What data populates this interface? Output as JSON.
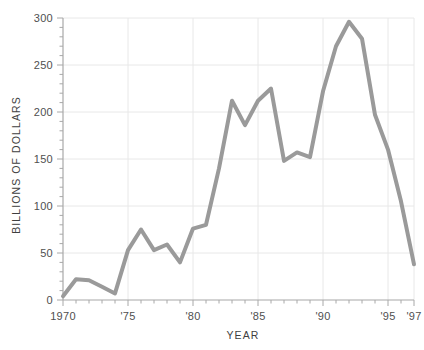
{
  "chart_data": {
    "type": "line",
    "title": "",
    "xlabel": "YEAR",
    "ylabel": "BILLIONS OF DOLLARS",
    "xlim": [
      1970,
      1997
    ],
    "ylim": [
      0,
      300
    ],
    "grid": true,
    "legend": null,
    "line_color": "#9a9a9a",
    "grid_color": "#e8e8e8",
    "axis_color": "#a8a8a8",
    "background_color": "#ffffff",
    "x": [
      1970,
      1971,
      1972,
      1973,
      1974,
      1975,
      1976,
      1977,
      1978,
      1979,
      1980,
      1981,
      1982,
      1983,
      1984,
      1985,
      1986,
      1987,
      1988,
      1989,
      1990,
      1991,
      1992,
      1993,
      1994,
      1995,
      1996,
      1997
    ],
    "values": [
      4,
      22,
      21,
      14,
      7,
      53,
      75,
      53,
      59,
      40,
      76,
      80,
      140,
      212,
      186,
      212,
      225,
      148,
      157,
      152,
      222,
      270,
      296,
      278,
      197,
      160,
      105,
      38
    ],
    "x_tick_values": [
      1970,
      1975,
      1980,
      1985,
      1990,
      1995,
      1997
    ],
    "x_tick_labels": [
      "1970",
      "'75",
      "'80",
      "'85",
      "'90",
      "'95",
      "'97"
    ],
    "y_tick_values": [
      0,
      50,
      100,
      150,
      200,
      250,
      300
    ],
    "y_tick_labels": [
      "0",
      "50",
      "100",
      "150",
      "200",
      "250",
      "300"
    ],
    "y_minor_step": 10,
    "x_minor_step": 1
  }
}
